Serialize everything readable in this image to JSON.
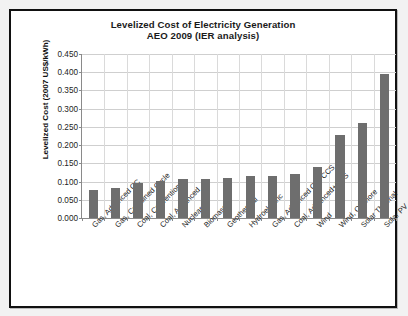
{
  "chart_data": {
    "type": "bar",
    "title": "Levelized Cost of Electricity Generation",
    "subtitle": "AEO 2009 (IER analysis)",
    "xlabel": "",
    "ylabel": "Levelized Cost (2007 US$/kWh)",
    "ylim": [
      0.0,
      0.45
    ],
    "ytick_labels": [
      "0.450",
      "0.400",
      "0.350",
      "0.300",
      "0.250",
      "0.200",
      "0.150",
      "0.100",
      "0.050",
      "0.000"
    ],
    "ytick_values": [
      0.45,
      0.4,
      0.35,
      0.3,
      0.25,
      0.2,
      0.15,
      0.1,
      0.05,
      0.0
    ],
    "grid": true,
    "legend": "none",
    "bar_color": "#6e6e6e",
    "categories": [
      "Gas, Advanced CC",
      "Gas, Combined Cycle",
      "Coal, Conventional",
      "Coal, Advanced",
      "Nuclear",
      "Biomass",
      "Geothermal",
      "Hydroelectric",
      "Gas, Advanced CC+CCS",
      "Coal, Advanced+CCS",
      "Wind",
      "Wind, Offshore",
      "Solar Thermal",
      "Solar PV"
    ],
    "values": [
      0.078,
      0.083,
      0.095,
      0.102,
      0.106,
      0.106,
      0.111,
      0.114,
      0.116,
      0.122,
      0.14,
      0.228,
      0.262,
      0.396
    ]
  }
}
